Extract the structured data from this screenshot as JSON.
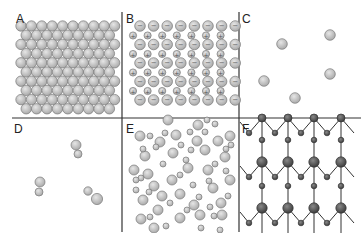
{
  "figure": {
    "panels": [
      {
        "id": "A",
        "label": "A",
        "content": "close-packed array of identical atoms (metal)"
      },
      {
        "id": "B",
        "label": "B",
        "content": "ionic lattice of alternating large negative ions and small positive ions",
        "ion_symbols": {
          "negative": "−",
          "positive": "+"
        }
      },
      {
        "id": "C",
        "label": "C",
        "content": "sparse monatomic gas, 5 atoms"
      },
      {
        "id": "D",
        "label": "D",
        "content": "sparse diatomic gas, 3 molecules"
      },
      {
        "id": "E",
        "label": "E",
        "content": "disordered network of molecules (amorphous / liquid)"
      },
      {
        "id": "F",
        "label": "F",
        "content": "covalent network lattice of large dark atoms and small dark atoms with bonds"
      }
    ],
    "colors": {
      "atom_fill": "#c4c4c4",
      "atom_stroke": "#7a7a7a",
      "dark_atom_fill": "#555555",
      "bond": "#333333",
      "divider": "#333333"
    }
  }
}
